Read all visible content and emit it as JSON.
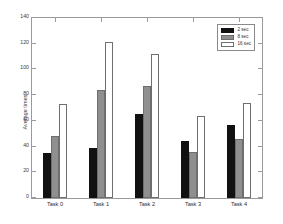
{
  "chart_data": {
    "type": "bar",
    "title": "",
    "xlabel": "",
    "ylabel": "Average times",
    "categories": [
      "Task 0",
      "Task 1",
      "Task 2",
      "Task 3",
      "Task 4"
    ],
    "series": [
      {
        "name": "2 sec",
        "color": "#111111",
        "values": [
          35,
          39,
          65,
          44,
          57
        ]
      },
      {
        "name": "8 sec",
        "color": "#8f8f8f",
        "values": [
          48,
          84,
          87,
          36,
          46
        ]
      },
      {
        "name": "16 sec",
        "color": "#ffffff",
        "values": [
          73,
          121,
          112,
          64,
          74
        ]
      }
    ],
    "ylim": [
      0,
      140
    ],
    "yticks": [
      0,
      20,
      40,
      60,
      80,
      100,
      120,
      140
    ],
    "ytick_labels": [
      "0",
      "20",
      "40",
      "60",
      "80",
      "100",
      "120",
      "140"
    ],
    "grid": false,
    "legend_position": "upper right"
  }
}
